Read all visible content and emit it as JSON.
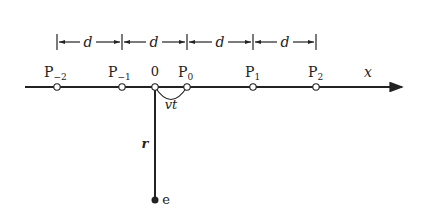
{
  "diagram": {
    "axis_label": "x",
    "spacing_label": "d",
    "spacing_count": 4,
    "origin_label": "0",
    "displacement_label": "vt",
    "distance_label": "r",
    "charge_label": "e",
    "points": [
      {
        "name": "P-2",
        "base": "P",
        "sub": "−2",
        "x": 57
      },
      {
        "name": "P-1",
        "base": "P",
        "sub": "−1",
        "x": 122
      },
      {
        "name": "P0",
        "base": "P",
        "sub": "0",
        "x": 187
      },
      {
        "name": "P1",
        "base": "P",
        "sub": "1",
        "x": 253
      },
      {
        "name": "P2",
        "base": "P",
        "sub": "2",
        "x": 316
      }
    ],
    "colors": {
      "ink": "#222222",
      "background": "#ffffff"
    }
  }
}
